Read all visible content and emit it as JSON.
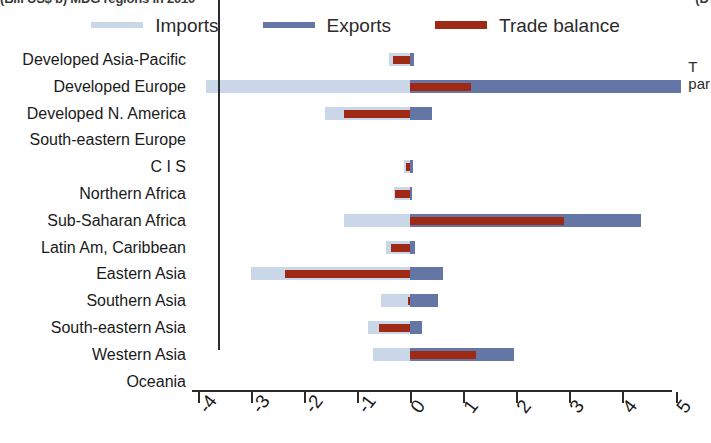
{
  "title_clipped": "(Bill US$ b) MDG regions in 2010",
  "title_right_clipped": "(D",
  "annotation_right_clipped": [
    "T",
    "par"
  ],
  "legend": {
    "position": "top-center",
    "items": [
      {
        "label": "Imports",
        "color": "#c9d7e8",
        "icon": "line-swatch-icon"
      },
      {
        "label": "Exports",
        "color": "#6476a5",
        "icon": "line-swatch-icon"
      },
      {
        "label": "Trade balance",
        "color": "#9e2a15",
        "icon": "line-swatch-icon"
      }
    ]
  },
  "axis": {
    "ticks": [
      "-4",
      "-3",
      "-2",
      "-1",
      "0",
      "1",
      "2",
      "3",
      "4",
      "5"
    ],
    "min": -4,
    "max": 5,
    "zero": 0,
    "grid": false
  },
  "chart_data": {
    "type": "bar",
    "orientation": "horizontal",
    "title": "(Bill US$ b) MDG regions in 2010",
    "xlabel": "",
    "ylabel": "",
    "xlim": [
      -4,
      5
    ],
    "grid": false,
    "legend_position": "top-center",
    "categories": [
      "Developed Asia-Pacific",
      "Developed Europe",
      "Developed N. America",
      "South-eastern Europe",
      "C I S",
      "Northern Africa",
      "Sub-Saharan Africa",
      "Latin Am, Caribbean",
      "Eastern Asia",
      "Southern Asia",
      "South-eastern Asia",
      "Western Asia",
      "Oceania"
    ],
    "series": [
      {
        "name": "Imports",
        "color": "#c9d7e8",
        "values": [
          -0.4,
          -3.85,
          -1.6,
          0.0,
          -0.12,
          -0.3,
          -1.25,
          -0.45,
          -3.0,
          -0.55,
          -0.8,
          -0.7,
          0.0
        ]
      },
      {
        "name": "Exports",
        "color": "#6476a5",
        "values": [
          0.08,
          5.1,
          0.42,
          0.0,
          0.05,
          0.02,
          4.35,
          0.1,
          0.62,
          0.52,
          0.22,
          1.95,
          0.0
        ]
      },
      {
        "name": "Trade balance",
        "color": "#9e2a15",
        "values": [
          -0.32,
          1.15,
          -1.25,
          0.0,
          -0.07,
          -0.28,
          2.9,
          -0.35,
          -2.35,
          -0.03,
          -0.58,
          1.25,
          0.0
        ]
      }
    ]
  }
}
